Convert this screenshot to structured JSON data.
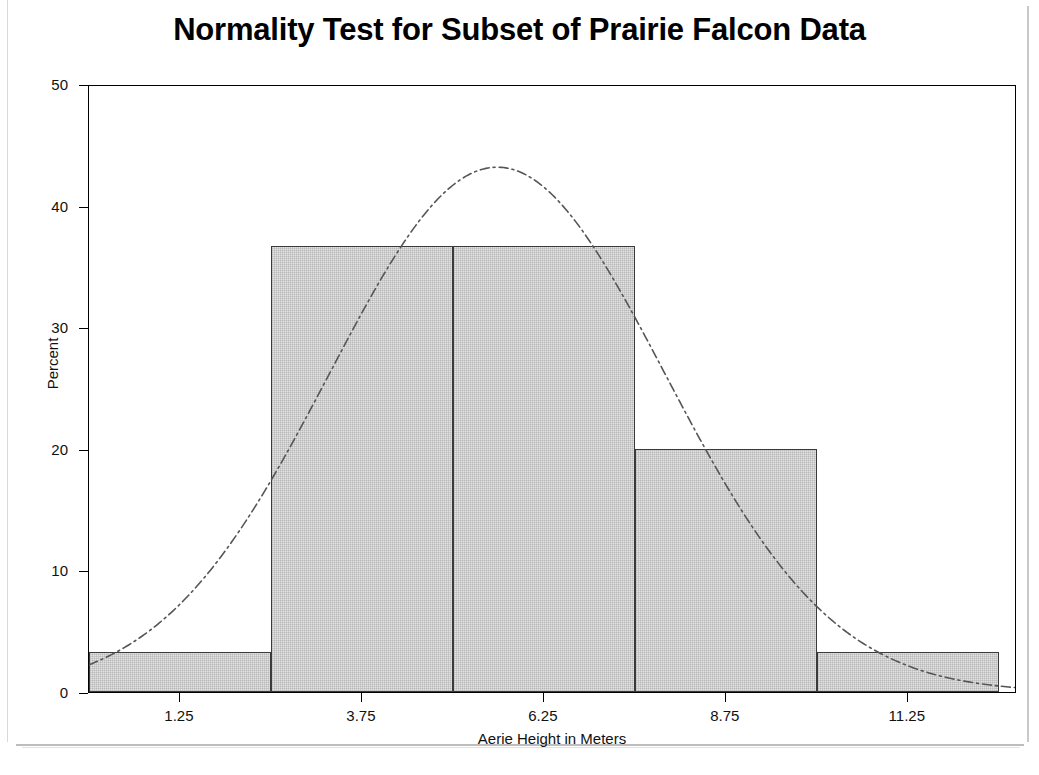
{
  "chart_data": {
    "type": "bar",
    "title": "Normality Test for Subset of Prairie Falcon Data",
    "xlabel": "Aerie Height in Meters",
    "ylabel": "Percent",
    "xlim": [
      0.0,
      12.75
    ],
    "ylim": [
      0,
      50
    ],
    "grid": false,
    "legend": null,
    "bin_width": 2.5,
    "bin_edges": [
      0.0,
      2.5,
      5.0,
      7.5,
      10.0,
      12.5
    ],
    "bin_midpoints": [
      1.25,
      3.75,
      6.25,
      8.75,
      11.25
    ],
    "categories": [
      "1.25",
      "3.75",
      "6.25",
      "8.75",
      "11.25"
    ],
    "values": [
      3.3,
      36.7,
      36.7,
      20.0,
      3.3
    ],
    "xticks": [
      1.25,
      3.75,
      6.25,
      8.75,
      11.25
    ],
    "xtick_labels": [
      "1.25",
      "3.75",
      "6.25",
      "8.75",
      "11.25"
    ],
    "yticks": [
      0,
      10,
      20,
      30,
      40,
      50
    ],
    "ytick_labels": [
      "0",
      "10",
      "20",
      "30",
      "40",
      "50"
    ],
    "overlay": {
      "name": "normal-density-curve",
      "style": "dash-dot",
      "mean": 5.62,
      "std_dev": 2.31,
      "peak_percent": 43.3,
      "peak_x": 5.62
    },
    "bar_fill_color": "#e3e3e3",
    "bar_edge_color": "#3a3a3a",
    "curve_color": "#555555",
    "axis_color": "#000000",
    "background_color": "#ffffff"
  }
}
